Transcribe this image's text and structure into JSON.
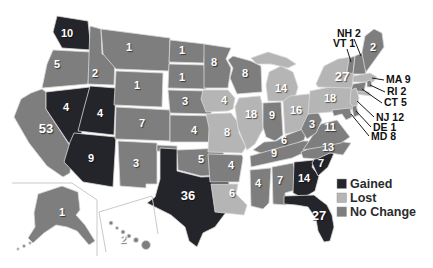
{
  "colors": {
    "gained": "#24242b",
    "lost": "#b5b5b5",
    "no_change": "#7e7e7e",
    "background": "#ffffff",
    "number_text": "#ffffff",
    "border": "#d9d9d9",
    "inset_border": "#c9c9c9",
    "callout_text": "#111111",
    "legend_text": "#2b2b2b"
  },
  "legend": {
    "items": [
      {
        "key": "gained",
        "label": "Gained"
      },
      {
        "key": "lost",
        "label": "Lost"
      },
      {
        "key": "no_change",
        "label": "No Change"
      }
    ]
  },
  "states": [
    {
      "id": "WA",
      "name": "Washington",
      "value": 10,
      "status": "gained"
    },
    {
      "id": "OR",
      "name": "Oregon",
      "value": 5,
      "status": "no_change"
    },
    {
      "id": "CA",
      "name": "California",
      "value": 53,
      "status": "no_change"
    },
    {
      "id": "NV",
      "name": "Nevada",
      "value": 4,
      "status": "gained"
    },
    {
      "id": "ID",
      "name": "Idaho",
      "value": 2,
      "status": "no_change"
    },
    {
      "id": "UT",
      "name": "Utah",
      "value": 4,
      "status": "gained"
    },
    {
      "id": "AZ",
      "name": "Arizona",
      "value": 9,
      "status": "gained"
    },
    {
      "id": "MT",
      "name": "Montana",
      "value": 1,
      "status": "no_change"
    },
    {
      "id": "WY",
      "name": "Wyoming",
      "value": 1,
      "status": "no_change"
    },
    {
      "id": "CO",
      "name": "Colorado",
      "value": 7,
      "status": "no_change"
    },
    {
      "id": "NM",
      "name": "New Mexico",
      "value": 3,
      "status": "no_change"
    },
    {
      "id": "ND",
      "name": "North Dakota",
      "value": 1,
      "status": "no_change"
    },
    {
      "id": "SD",
      "name": "South Dakota",
      "value": 1,
      "status": "no_change"
    },
    {
      "id": "NE",
      "name": "Nebraska",
      "value": 3,
      "status": "no_change"
    },
    {
      "id": "KS",
      "name": "Kansas",
      "value": 4,
      "status": "no_change"
    },
    {
      "id": "OK",
      "name": "Oklahoma",
      "value": 5,
      "status": "no_change"
    },
    {
      "id": "TX",
      "name": "Texas",
      "value": 36,
      "status": "gained"
    },
    {
      "id": "MN",
      "name": "Minnesota",
      "value": 8,
      "status": "no_change"
    },
    {
      "id": "IA",
      "name": "Iowa",
      "value": 4,
      "status": "lost"
    },
    {
      "id": "MO",
      "name": "Missouri",
      "value": 8,
      "status": "lost"
    },
    {
      "id": "AR",
      "name": "Arkansas",
      "value": 4,
      "status": "no_change"
    },
    {
      "id": "LA",
      "name": "Louisiana",
      "value": 6,
      "status": "lost"
    },
    {
      "id": "WI",
      "name": "Wisconsin",
      "value": 8,
      "status": "no_change"
    },
    {
      "id": "IL",
      "name": "Illinois",
      "value": 18,
      "status": "lost"
    },
    {
      "id": "IN",
      "name": "Indiana",
      "value": 9,
      "status": "no_change"
    },
    {
      "id": "MI",
      "name": "Michigan",
      "value": 14,
      "status": "lost"
    },
    {
      "id": "OH",
      "name": "Ohio",
      "value": 16,
      "status": "lost"
    },
    {
      "id": "KY",
      "name": "Kentucky",
      "value": 6,
      "status": "no_change"
    },
    {
      "id": "TN",
      "name": "Tennessee",
      "value": 9,
      "status": "no_change"
    },
    {
      "id": "MS",
      "name": "Mississippi",
      "value": 4,
      "status": "no_change"
    },
    {
      "id": "AL",
      "name": "Alabama",
      "value": 7,
      "status": "no_change"
    },
    {
      "id": "GA",
      "name": "Georgia",
      "value": 14,
      "status": "gained"
    },
    {
      "id": "FL",
      "name": "Florida",
      "value": 27,
      "status": "gained"
    },
    {
      "id": "SC",
      "name": "South Carolina",
      "value": 7,
      "status": "gained"
    },
    {
      "id": "NC",
      "name": "North Carolina",
      "value": 13,
      "status": "no_change"
    },
    {
      "id": "VA",
      "name": "Virginia",
      "value": 11,
      "status": "no_change"
    },
    {
      "id": "WV",
      "name": "West Virginia",
      "value": 3,
      "status": "no_change"
    },
    {
      "id": "PA",
      "name": "Pennsylvania",
      "value": 18,
      "status": "lost"
    },
    {
      "id": "NY",
      "name": "New York",
      "value": 27,
      "status": "lost"
    },
    {
      "id": "ME",
      "name": "Maine",
      "value": 2,
      "status": "no_change"
    },
    {
      "id": "VT",
      "name": "Vermont",
      "value": 1,
      "status": "no_change"
    },
    {
      "id": "NH",
      "name": "New Hampshire",
      "value": 2,
      "status": "no_change"
    },
    {
      "id": "MA",
      "name": "Massachusetts",
      "value": 9,
      "status": "lost"
    },
    {
      "id": "RI",
      "name": "Rhode Island",
      "value": 2,
      "status": "no_change"
    },
    {
      "id": "CT",
      "name": "Connecticut",
      "value": 5,
      "status": "no_change"
    },
    {
      "id": "NJ",
      "name": "New Jersey",
      "value": 12,
      "status": "lost"
    },
    {
      "id": "DE",
      "name": "Delaware",
      "value": 1,
      "status": "no_change"
    },
    {
      "id": "MD",
      "name": "Maryland",
      "value": 8,
      "status": "no_change"
    },
    {
      "id": "AK",
      "name": "Alaska",
      "value": 1,
      "status": "no_change"
    },
    {
      "id": "HI",
      "name": "Hawaii",
      "value": 2,
      "status": "no_change"
    }
  ],
  "callouts": [
    {
      "id": "NH",
      "label": "NH 2"
    },
    {
      "id": "VT",
      "label": "VT 1"
    },
    {
      "id": "MA",
      "label": "MA 9"
    },
    {
      "id": "RI",
      "label": "RI 2"
    },
    {
      "id": "CT",
      "label": "CT 5"
    },
    {
      "id": "NJ",
      "label": "NJ 12"
    },
    {
      "id": "DE",
      "label": "DE 1"
    },
    {
      "id": "MD",
      "label": "MD 8"
    }
  ]
}
